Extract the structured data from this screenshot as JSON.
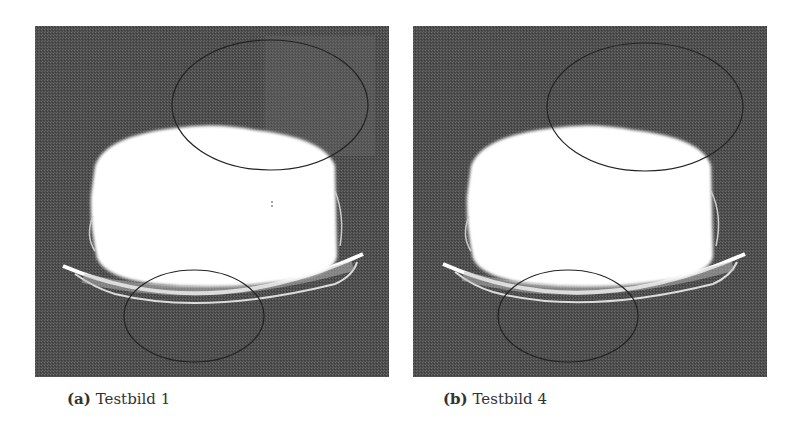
{
  "figures": [
    {
      "label": "(a)",
      "caption": "Testbild 1",
      "colors": {
        "background": "#555555",
        "object": "#ffffff",
        "ellipse_stroke": "#222222"
      }
    },
    {
      "label": "(b)",
      "caption": "Testbild 4",
      "colors": {
        "background": "#555555",
        "object": "#ffffff",
        "ellipse_stroke": "#222222"
      }
    }
  ]
}
